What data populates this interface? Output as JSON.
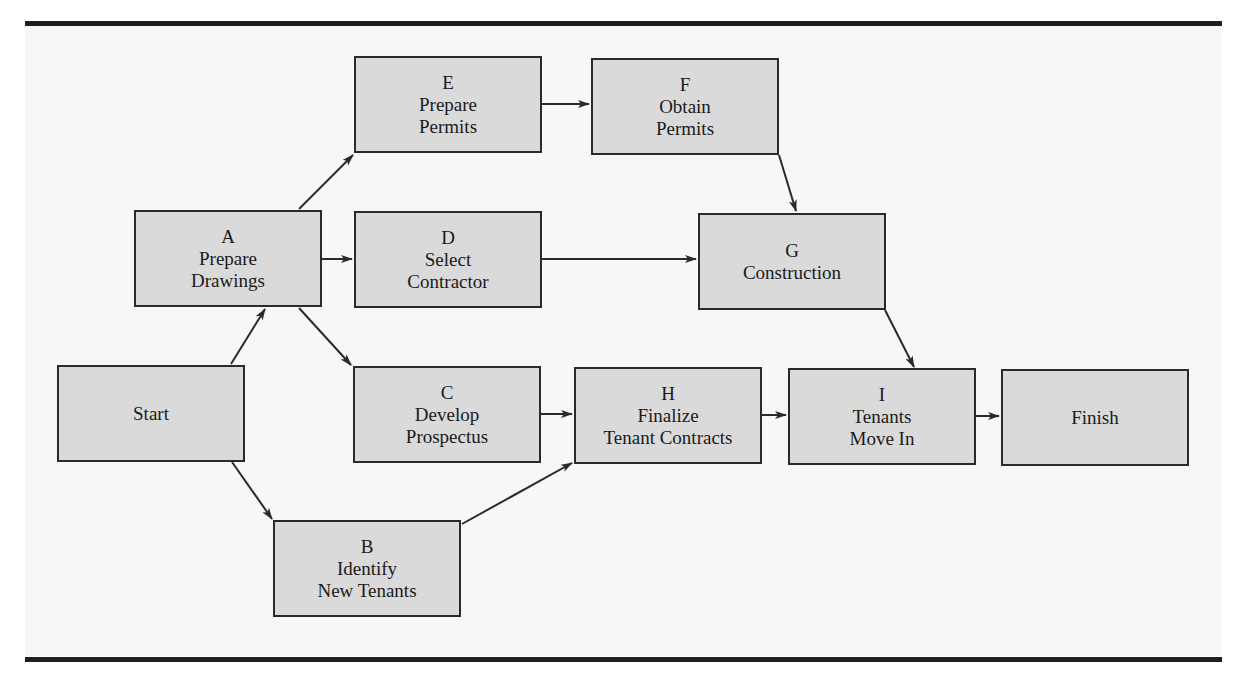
{
  "diagram": {
    "type": "activity-network",
    "nodes": [
      {
        "id": "start",
        "letter": "",
        "line1": "Start",
        "line2": "",
        "x": 57,
        "y": 365
      },
      {
        "id": "A",
        "letter": "A",
        "line1": "Prepare",
        "line2": "Drawings",
        "x": 134,
        "y": 210
      },
      {
        "id": "B",
        "letter": "B",
        "line1": "Identify",
        "line2": "New Tenants",
        "x": 273,
        "y": 520
      },
      {
        "id": "C",
        "letter": "C",
        "line1": "Develop",
        "line2": "Prospectus",
        "x": 353,
        "y": 366
      },
      {
        "id": "D",
        "letter": "D",
        "line1": "Select",
        "line2": "Contractor",
        "x": 354,
        "y": 211
      },
      {
        "id": "E",
        "letter": "E",
        "line1": "Prepare",
        "line2": "Permits",
        "x": 354,
        "y": 56
      },
      {
        "id": "F",
        "letter": "F",
        "line1": "Obtain",
        "line2": "Permits",
        "x": 591,
        "y": 58
      },
      {
        "id": "G",
        "letter": "G",
        "line1": "Construction",
        "line2": "",
        "x": 698,
        "y": 213
      },
      {
        "id": "H",
        "letter": "H",
        "line1": "Finalize",
        "line2": "Tenant Contracts",
        "x": 574,
        "y": 367
      },
      {
        "id": "I",
        "letter": "I",
        "line1": "Tenants",
        "line2": "Move In",
        "x": 788,
        "y": 368
      },
      {
        "id": "finish",
        "letter": "",
        "line1": "Finish",
        "line2": "",
        "x": 1001,
        "y": 369
      }
    ],
    "edges": [
      {
        "from": "start",
        "to": "A"
      },
      {
        "from": "start",
        "to": "B"
      },
      {
        "from": "A",
        "to": "E"
      },
      {
        "from": "A",
        "to": "D"
      },
      {
        "from": "A",
        "to": "C"
      },
      {
        "from": "E",
        "to": "F"
      },
      {
        "from": "F",
        "to": "G"
      },
      {
        "from": "D",
        "to": "G"
      },
      {
        "from": "C",
        "to": "H"
      },
      {
        "from": "B",
        "to": "H"
      },
      {
        "from": "G",
        "to": "I"
      },
      {
        "from": "H",
        "to": "I"
      },
      {
        "from": "I",
        "to": "finish"
      }
    ],
    "colors": {
      "box_fill": "#dadada",
      "box_border": "#2a2a2a",
      "arrow": "#2a2a2a",
      "rule": "#1e1e1e"
    }
  }
}
